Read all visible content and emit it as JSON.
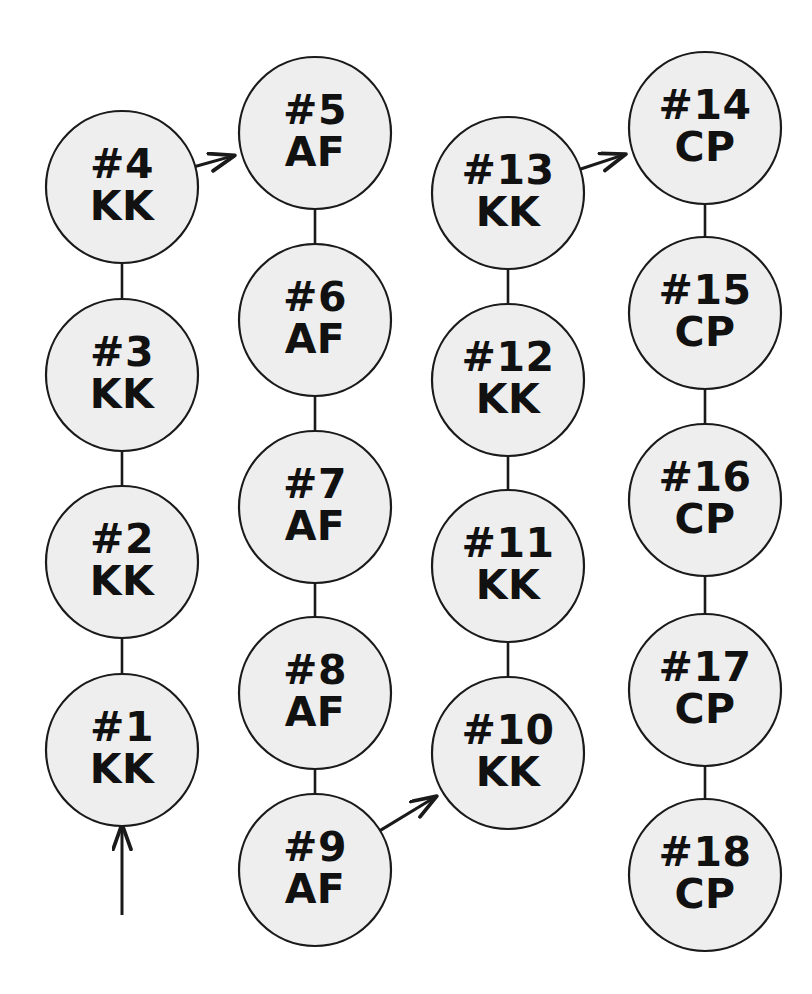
{
  "diagram": {
    "title": "",
    "background_color": "#ffffff",
    "node_fill_color": "#eeeeee",
    "node_stroke_color": "#1a1a1a",
    "text_color": "#111111",
    "node_radius": 76,
    "nodes": [
      {
        "id": "n1",
        "number": "#1",
        "code": "KK",
        "cx": 122,
        "cy": 750,
        "column": 1
      },
      {
        "id": "n2",
        "number": "#2",
        "code": "KK",
        "cx": 122,
        "cy": 562,
        "column": 1
      },
      {
        "id": "n3",
        "number": "#3",
        "code": "KK",
        "cx": 122,
        "cy": 375,
        "column": 1
      },
      {
        "id": "n4",
        "number": "#4",
        "code": "KK",
        "cx": 122,
        "cy": 187,
        "column": 1
      },
      {
        "id": "n5",
        "number": "#5",
        "code": "AF",
        "cx": 315,
        "cy": 133,
        "column": 2
      },
      {
        "id": "n6",
        "number": "#6",
        "code": "AF",
        "cx": 315,
        "cy": 320,
        "column": 2
      },
      {
        "id": "n7",
        "number": "#7",
        "code": "AF",
        "cx": 315,
        "cy": 507,
        "column": 2
      },
      {
        "id": "n8",
        "number": "#8",
        "code": "AF",
        "cx": 315,
        "cy": 693,
        "column": 2
      },
      {
        "id": "n9",
        "number": "#9",
        "code": "AF",
        "cx": 315,
        "cy": 870,
        "column": 2
      },
      {
        "id": "n10",
        "number": "#10",
        "code": "KK",
        "cx": 508,
        "cy": 753,
        "column": 3
      },
      {
        "id": "n11",
        "number": "#11",
        "code": "KK",
        "cx": 508,
        "cy": 566,
        "column": 3
      },
      {
        "id": "n12",
        "number": "#12",
        "code": "KK",
        "cx": 508,
        "cy": 380,
        "column": 3
      },
      {
        "id": "n13",
        "number": "#13",
        "code": "KK",
        "cx": 508,
        "cy": 193,
        "column": 3
      },
      {
        "id": "n14",
        "number": "#14",
        "code": "CP",
        "cx": 705,
        "cy": 128,
        "column": 4
      },
      {
        "id": "n15",
        "number": "#15",
        "code": "CP",
        "cx": 705,
        "cy": 313,
        "column": 4
      },
      {
        "id": "n16",
        "number": "#16",
        "code": "CP",
        "cx": 705,
        "cy": 500,
        "column": 4
      },
      {
        "id": "n17",
        "number": "#17",
        "code": "CP",
        "cx": 705,
        "cy": 690,
        "column": 4
      },
      {
        "id": "n18",
        "number": "#18",
        "code": "CP",
        "cx": 705,
        "cy": 875,
        "column": 4
      }
    ],
    "edges": [
      {
        "from": "n1",
        "to": "n2",
        "kind": "plain"
      },
      {
        "from": "n2",
        "to": "n3",
        "kind": "plain"
      },
      {
        "from": "n3",
        "to": "n4",
        "kind": "plain"
      },
      {
        "from": "n4",
        "to": "n5",
        "kind": "arrow"
      },
      {
        "from": "n5",
        "to": "n6",
        "kind": "plain"
      },
      {
        "from": "n6",
        "to": "n7",
        "kind": "plain"
      },
      {
        "from": "n7",
        "to": "n8",
        "kind": "plain"
      },
      {
        "from": "n8",
        "to": "n9",
        "kind": "plain"
      },
      {
        "from": "n9",
        "to": "n10",
        "kind": "arrow"
      },
      {
        "from": "n10",
        "to": "n11",
        "kind": "plain"
      },
      {
        "from": "n11",
        "to": "n12",
        "kind": "plain"
      },
      {
        "from": "n12",
        "to": "n13",
        "kind": "plain"
      },
      {
        "from": "n13",
        "to": "n14",
        "kind": "arrow"
      },
      {
        "from": "n14",
        "to": "n15",
        "kind": "plain"
      },
      {
        "from": "n15",
        "to": "n16",
        "kind": "plain"
      },
      {
        "from": "n16",
        "to": "n17",
        "kind": "plain"
      },
      {
        "from": "n17",
        "to": "n18",
        "kind": "plain"
      }
    ],
    "entry_arrow": {
      "label": "entry-arrow",
      "x": 122,
      "y_start": 915,
      "y_end": 826,
      "direction": "up",
      "target": "n1"
    }
  }
}
